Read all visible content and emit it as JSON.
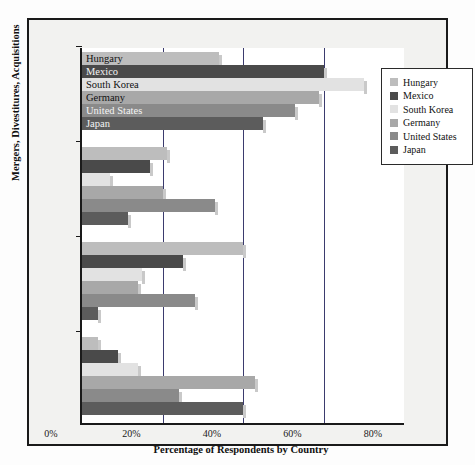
{
  "chart_data": {
    "type": "bar",
    "orientation": "horizontal",
    "title": "",
    "xlabel": "Percentage of Respondents by Country",
    "ylabel": "Mergers, Divestitures, Acquisitions",
    "xlim": [
      0,
      80
    ],
    "xticks": [
      "0%",
      "20%",
      "40%",
      "60%",
      "80%"
    ],
    "xtick_values": [
      0,
      20,
      40,
      60,
      80
    ],
    "grid": true,
    "legend_position": "top-right",
    "series": [
      {
        "name": "Hungary",
        "color": "#bdbdbd",
        "values": [
          34,
          21,
          40,
          4
        ]
      },
      {
        "name": "Mexico",
        "color": "#4a4a4a",
        "values": [
          60,
          17,
          25,
          9
        ]
      },
      {
        "name": "South Korea",
        "color": "#e2e2e2",
        "values": [
          70,
          7,
          15,
          14
        ]
      },
      {
        "name": "Germany",
        "color": "#a8a8a8",
        "values": [
          59,
          20,
          14,
          43
        ]
      },
      {
        "name": "United States",
        "color": "#8a8a8a",
        "values": [
          53,
          33,
          28,
          24
        ]
      },
      {
        "name": "Japan",
        "color": "#5c5c5c",
        "values": [
          45,
          11.5,
          4,
          40
        ]
      }
    ],
    "groups": [
      {
        "index": 0,
        "labels_on_bars": true
      },
      {
        "index": 1,
        "labels_on_bars": false
      },
      {
        "index": 2,
        "labels_on_bars": false
      },
      {
        "index": 3,
        "labels_on_bars": false
      }
    ],
    "bar_labels_group1": [
      "Hungary",
      "Mexico",
      "South Korea",
      "Germany",
      "United States",
      "Japan"
    ]
  },
  "legend": {
    "items": [
      {
        "label": "Hungary",
        "color": "#bdbdbd"
      },
      {
        "label": "Mexico",
        "color": "#4a4a4a"
      },
      {
        "label": "South Korea",
        "color": "#e2e2e2"
      },
      {
        "label": "Germany",
        "color": "#a8a8a8"
      },
      {
        "label": "United States",
        "color": "#8a8a8a"
      },
      {
        "label": "Japan",
        "color": "#5c5c5c"
      }
    ]
  },
  "axes": {
    "x_title": "Percentage of Respondents by Country",
    "y_title": "Mergers, Divestitures, Acquisitions"
  },
  "colors": {
    "frame": "#1a1a1a",
    "panel_bg": "#f2f2f0",
    "plot_bg": "#ffffff",
    "gridline": "#3b3b6e",
    "bar_shadow": "#c9c9c9"
  }
}
